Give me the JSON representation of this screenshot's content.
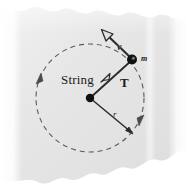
{
  "figure": {
    "background_color": "#e6e6e6",
    "page_edge_color": "#ffffff",
    "ink_color": "#2b2b2b",
    "dashed_circle_color": "#555555",
    "labels": {
      "string": "String",
      "tension": "T",
      "velocity": "v",
      "mass": "m",
      "radius": "r"
    }
  },
  "diagram_data": {
    "type": "physics-free-body",
    "center": {
      "x": 90,
      "y": 98,
      "marker": "filled-dot"
    },
    "ball": {
      "x": 132,
      "y": 60,
      "marker": "filled-dot",
      "label": "m"
    },
    "circle": {
      "cx": 90,
      "cy": 98,
      "r": 54,
      "style": "dashed",
      "direction": "counterclockwise"
    },
    "vectors": [
      {
        "name": "velocity",
        "label": "v",
        "from": {
          "x": 132,
          "y": 60
        },
        "to": {
          "x": 103,
          "y": 32
        },
        "arrowhead": "open"
      },
      {
        "name": "tension",
        "label": "T",
        "from": {
          "x": 132,
          "y": 60
        },
        "to": {
          "x": 104,
          "y": 80
        },
        "arrowhead": "open"
      },
      {
        "name": "radius",
        "label": "r",
        "from": {
          "x": 90,
          "y": 98
        },
        "to": {
          "x": 133,
          "y": 133
        },
        "arrowhead": "solid"
      }
    ],
    "motion_arrows": [
      {
        "name": "ccw-arrow-left",
        "x": 39,
        "y": 79,
        "angle": 200
      },
      {
        "name": "ccw-arrow-right",
        "x": 141,
        "y": 121,
        "angle": 20
      }
    ]
  }
}
